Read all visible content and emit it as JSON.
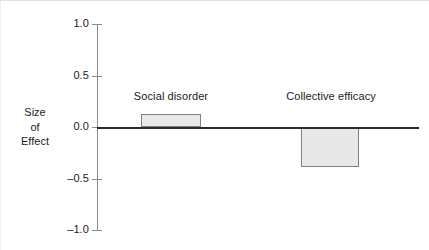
{
  "chart_data": {
    "type": "bar",
    "title": "",
    "subtitle": "",
    "xlabel": "",
    "ylabel": "Size of Effect",
    "ylabel_lines": [
      "Size",
      "of",
      "Effect"
    ],
    "categories": [
      "Social disorder",
      "Collective efficacy"
    ],
    "values": [
      0.13,
      -0.39
    ],
    "ylim": [
      -1.0,
      1.0
    ],
    "yticks": [
      1.0,
      0.5,
      0.0,
      -0.5,
      -1.0
    ],
    "ytick_labels": [
      "1.0",
      "0.5",
      "0.0",
      "–0.5",
      "–1.0"
    ],
    "grid": false,
    "legend": "none",
    "bar_fill_color": "#e8e8e8",
    "bar_border_color": "#808080",
    "axis_color": "#8a8a8a",
    "zero_line_color": "#2b2b2b",
    "background_color": "#ffffff"
  }
}
